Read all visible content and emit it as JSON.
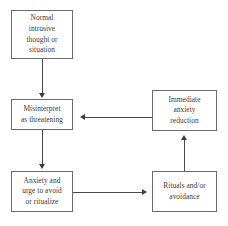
{
  "diagram": {
    "type": "flowchart",
    "background_color": "#ffffff",
    "box_border_color": "#6b6b6b",
    "arrow_color": "#3d3d3d",
    "text_color": "#3a3a3a",
    "top_cut_text": "",
    "nodes": [
      {
        "id": "normal-intrusive-thought",
        "label": "Normal intrusive thought or situation",
        "lines": [
          "Normal",
          "intrusive",
          "thought or",
          "situation"
        ],
        "x": 11,
        "y": 10,
        "w": 62,
        "h": 49
      },
      {
        "id": "misinterpret-as-threatening",
        "label": "Misinterpret as threatening",
        "lines": [
          "Misinterpret",
          "as threatening"
        ],
        "x": 11,
        "y": 99,
        "w": 62,
        "h": 31
      },
      {
        "id": "anxiety-and-urge",
        "label": "Anxiety and urge to avoid or ritualize",
        "lines": [
          "Anxiety and",
          "urge to avoid",
          "or ritualize"
        ],
        "x": 11,
        "y": 171,
        "w": 62,
        "h": 41
      },
      {
        "id": "immediate-anxiety-reduction",
        "label": "Immediate anxiety reduction",
        "lines": [
          "Immediate",
          "anxiety",
          "reduction"
        ],
        "x": 152,
        "y": 90,
        "w": 65,
        "h": 41
      },
      {
        "id": "rituals-and-or-avoidance",
        "label": "Rituals and/or avoidance",
        "lines": [
          "Rituals and/or",
          "avoidance"
        ],
        "x": 152,
        "y": 171,
        "w": 65,
        "h": 41
      }
    ],
    "edges": [
      {
        "id": "edge-thought-to-misinterpret",
        "from": "normal-intrusive-thought",
        "to": "misinterpret-as-threatening",
        "direction": "down"
      },
      {
        "id": "edge-misinterpret-to-anxiety",
        "from": "misinterpret-as-threatening",
        "to": "anxiety-and-urge",
        "direction": "down"
      },
      {
        "id": "edge-anxiety-to-rituals",
        "from": "anxiety-and-urge",
        "to": "rituals-and-or-avoidance",
        "direction": "right"
      },
      {
        "id": "edge-rituals-to-reduction",
        "from": "rituals-and-or-avoidance",
        "to": "immediate-anxiety-reduction",
        "direction": "up"
      },
      {
        "id": "edge-reduction-to-misinterpret",
        "from": "immediate-anxiety-reduction",
        "to": "misinterpret-as-threatening",
        "direction": "left"
      }
    ]
  }
}
